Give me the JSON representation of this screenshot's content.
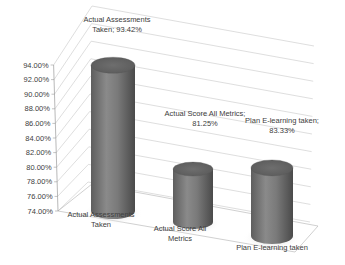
{
  "chart_data": {
    "type": "bar",
    "style": "3d-cylinder",
    "title": "",
    "xlabel": "",
    "ylabel": "",
    "categories": [
      "Actual Assessments Taken",
      "Actual Score All Metrics",
      "Plan E-learning taken"
    ],
    "category_label_lines": [
      [
        "Actual Assessments",
        "Taken"
      ],
      [
        "Actual Score All",
        "Metrics"
      ],
      [
        "Plan E-learning taken"
      ]
    ],
    "values": [
      93.42,
      81.25,
      83.33
    ],
    "data_labels": [
      [
        "Actual Assessments",
        "Taken; 93.42%"
      ],
      [
        "Actual Score All Metrics;",
        "81.25%"
      ],
      [
        "Plan E-learning taken;",
        "83.33%"
      ]
    ],
    "ylim": [
      74,
      94
    ],
    "yticks": [
      "74.00%",
      "76.00%",
      "78.00%",
      "80.00%",
      "82.00%",
      "84.00%",
      "86.00%",
      "88.00%",
      "90.00%",
      "92.00%",
      "94.00%"
    ],
    "grid": true,
    "legend": "none",
    "bar_color": "#7f7f7f"
  }
}
